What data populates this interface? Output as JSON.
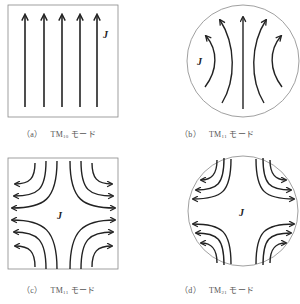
{
  "figure": {
    "panels": [
      {
        "id": "a",
        "shape": "square",
        "caption_letter": "（a）",
        "mode_prefix": "TM",
        "mode_sub": "10",
        "mode_suffix": " モード",
        "field_label": "J"
      },
      {
        "id": "b",
        "shape": "circle",
        "caption_letter": "（b）",
        "mode_prefix": "TM",
        "mode_sub": "11",
        "mode_suffix": " モード",
        "field_label": "J"
      },
      {
        "id": "c",
        "shape": "square",
        "caption_letter": "（c）",
        "mode_prefix": "TM",
        "mode_sub": "11",
        "mode_suffix": " モード",
        "field_label": "J"
      },
      {
        "id": "d",
        "shape": "circle",
        "caption_letter": "（d）",
        "mode_prefix": "TM",
        "mode_sub": "21",
        "mode_suffix": " モード",
        "field_label": "J"
      }
    ],
    "colors": {
      "line": "#222222",
      "outline": "#888888",
      "caption": "#555555"
    }
  }
}
